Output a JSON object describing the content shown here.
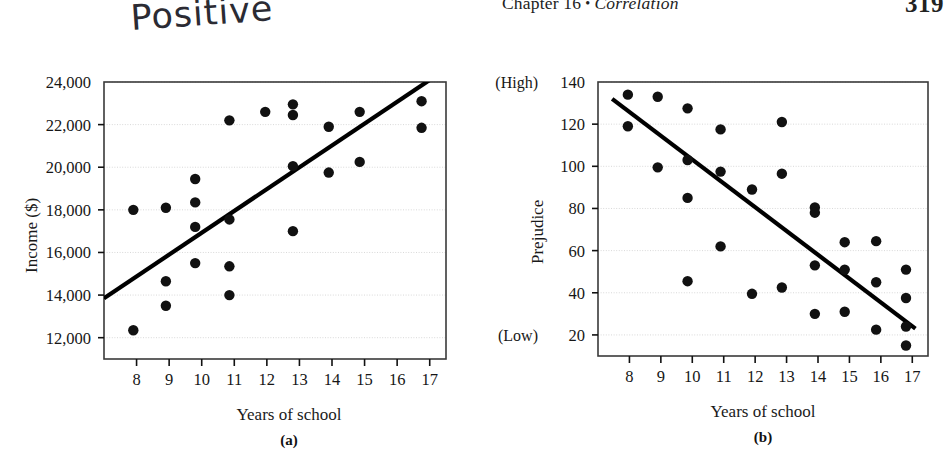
{
  "running_head": {
    "chapter_label": "Chapter 16",
    "bullet": "•",
    "chapter_title": "Correlation",
    "page_number": "319"
  },
  "annotation": {
    "handwritten_note": "Positive"
  },
  "figure": {
    "panel_a_label": "(a)",
    "panel_b_label": "(b)"
  },
  "chart_data": [
    {
      "id": "panel-a",
      "type": "scatter",
      "title": "",
      "xlabel": "Years of school",
      "ylabel": "Income ($)",
      "xlim": [
        7,
        17.5
      ],
      "ylim": [
        11000,
        24000
      ],
      "xticks": [
        8,
        9,
        10,
        11,
        12,
        13,
        14,
        15,
        16,
        17
      ],
      "xticklabels": [
        "8",
        "9",
        "10",
        "11",
        "12",
        "13",
        "14",
        "15",
        "16",
        "17"
      ],
      "yticks": [
        12000,
        14000,
        16000,
        18000,
        20000,
        22000,
        24000
      ],
      "yticklabels": [
        "12,000",
        "14,000",
        "16,000",
        "18,000",
        "20,000",
        "22,000",
        "24,000"
      ],
      "grid": true,
      "points": [
        [
          7.9,
          18000
        ],
        [
          7.9,
          12350
        ],
        [
          8.9,
          18100
        ],
        [
          8.9,
          14650
        ],
        [
          8.9,
          13500
        ],
        [
          9.8,
          19450
        ],
        [
          9.8,
          18350
        ],
        [
          9.8,
          17200
        ],
        [
          9.8,
          15500
        ],
        [
          10.85,
          22200
        ],
        [
          10.85,
          17550
        ],
        [
          10.85,
          15350
        ],
        [
          10.85,
          14000
        ],
        [
          11.95,
          22600
        ],
        [
          12.8,
          22950
        ],
        [
          12.8,
          22450
        ],
        [
          12.8,
          20050
        ],
        [
          12.8,
          17000
        ],
        [
          13.9,
          21900
        ],
        [
          13.9,
          19750
        ],
        [
          14.85,
          22600
        ],
        [
          14.85,
          20250
        ],
        [
          16.75,
          23100
        ],
        [
          16.75,
          21850
        ]
      ],
      "trendline": {
        "x0": 7.0,
        "y0": 13850,
        "x1": 17.2,
        "y1": 24300,
        "direction": "positive"
      }
    },
    {
      "id": "panel-b",
      "type": "scatter",
      "title": "",
      "xlabel": "Years of school",
      "ylabel": "Prejudice",
      "ylabel_high": "(High)",
      "ylabel_low": "(Low)",
      "xlim": [
        7,
        17.5
      ],
      "ylim": [
        10,
        140
      ],
      "xticks": [
        8,
        9,
        10,
        11,
        12,
        13,
        14,
        15,
        16,
        17
      ],
      "xticklabels": [
        "8",
        "9",
        "10",
        "11",
        "12",
        "13",
        "14",
        "15",
        "16",
        "17"
      ],
      "yticks": [
        20,
        40,
        60,
        80,
        100,
        120,
        140
      ],
      "yticklabels": [
        "20",
        "40",
        "60",
        "80",
        "100",
        "120",
        "140"
      ],
      "grid": true,
      "points": [
        [
          7.95,
          134
        ],
        [
          7.95,
          119
        ],
        [
          8.9,
          133
        ],
        [
          8.9,
          99.5
        ],
        [
          9.85,
          127.5
        ],
        [
          9.85,
          103
        ],
        [
          9.85,
          85
        ],
        [
          9.85,
          45.5
        ],
        [
          10.9,
          117.5
        ],
        [
          10.9,
          97.5
        ],
        [
          10.9,
          62
        ],
        [
          11.9,
          89
        ],
        [
          11.9,
          39.5
        ],
        [
          12.85,
          121
        ],
        [
          12.85,
          96.5
        ],
        [
          12.85,
          42.5
        ],
        [
          13.9,
          80.5
        ],
        [
          13.9,
          78
        ],
        [
          13.9,
          53
        ],
        [
          13.9,
          30
        ],
        [
          14.85,
          64
        ],
        [
          14.85,
          51
        ],
        [
          14.85,
          31
        ],
        [
          15.85,
          64.5
        ],
        [
          15.85,
          45
        ],
        [
          15.85,
          22.5
        ],
        [
          16.8,
          51
        ],
        [
          16.8,
          37.5
        ],
        [
          16.8,
          24
        ],
        [
          16.8,
          15
        ]
      ],
      "trendline": {
        "x0": 7.45,
        "y0": 132,
        "x1": 17.1,
        "y1": 23,
        "direction": "negative"
      }
    }
  ],
  "colors": {
    "point": "#111111",
    "trendline": "#000000",
    "frame": "#3a3a3a",
    "grid": "#d8d8d8",
    "text": "#1a1a1a"
  }
}
